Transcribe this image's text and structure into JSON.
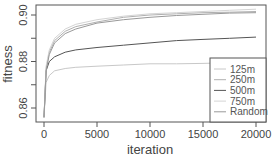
{
  "chart_data": {
    "type": "line",
    "title": "",
    "xlabel": "iteration",
    "ylabel": "fitness",
    "xlim": [
      0,
      20000
    ],
    "ylim": [
      0.855,
      0.905
    ],
    "x_ticks": [
      "0",
      "5000",
      "10000",
      "15000",
      "20000"
    ],
    "y_ticks": [
      "0.86",
      "0.88",
      "0.90"
    ],
    "grid": false,
    "legend_position": "bottom-right",
    "x": [
      0,
      200,
      500,
      1000,
      2000,
      3000,
      5000,
      7500,
      10000,
      12500,
      15000,
      17500,
      20000
    ],
    "series": [
      {
        "name": "125m",
        "color": "#c8c8c8",
        "values": [
          0.856,
          0.871,
          0.874,
          0.876,
          0.877,
          0.8775,
          0.878,
          0.8785,
          0.879,
          0.879,
          0.8792,
          0.8795,
          0.8797
        ]
      },
      {
        "name": "250m",
        "color": "#b0b0b0",
        "values": [
          0.856,
          0.877,
          0.884,
          0.889,
          0.893,
          0.895,
          0.897,
          0.899,
          0.9,
          0.9005,
          0.901,
          0.9012,
          0.9015
        ]
      },
      {
        "name": "500m",
        "color": "#555555",
        "values": [
          0.856,
          0.876,
          0.88,
          0.882,
          0.884,
          0.885,
          0.886,
          0.887,
          0.888,
          0.889,
          0.8895,
          0.89,
          0.8905
        ]
      },
      {
        "name": "750m",
        "color": "#d4d4d4",
        "values": [
          0.856,
          0.878,
          0.885,
          0.89,
          0.894,
          0.896,
          0.898,
          0.8995,
          0.9005,
          0.901,
          0.9015,
          0.902,
          0.9025
        ]
      },
      {
        "name": "Random",
        "color": "#999999",
        "values": [
          0.856,
          0.876,
          0.883,
          0.888,
          0.892,
          0.894,
          0.8965,
          0.898,
          0.899,
          0.8998,
          0.9003,
          0.9008,
          0.901
        ]
      }
    ]
  }
}
